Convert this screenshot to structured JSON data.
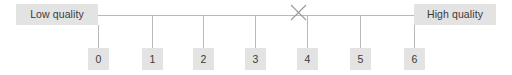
{
  "widget": {
    "type": "likert-rating-scale",
    "orientation": "horizontal",
    "colors": {
      "box_fill": "#e3e3e3",
      "text": "#3a3a3a",
      "line": "#b9b9b9",
      "mark": "#9a9a9a",
      "background": "#ffffff"
    }
  },
  "anchors": {
    "low": {
      "label": "Low quality",
      "value": 0
    },
    "high": {
      "label": "High quality",
      "value": 6
    }
  },
  "scale": {
    "min": 0,
    "max": 6,
    "points": [
      {
        "label": "0",
        "value": 0,
        "x": 98
      },
      {
        "label": "1",
        "value": 1,
        "x": 152
      },
      {
        "label": "2",
        "value": 2,
        "x": 203
      },
      {
        "label": "3",
        "value": 3,
        "x": 255
      },
      {
        "label": "4",
        "value": 4,
        "x": 307
      },
      {
        "label": "5",
        "value": 5,
        "x": 360
      },
      {
        "label": "6",
        "value": 6,
        "x": 414
      }
    ]
  },
  "response": {
    "marker": "x-mark",
    "selected_value": 4,
    "marker_x": 298,
    "marker_y": 12
  }
}
